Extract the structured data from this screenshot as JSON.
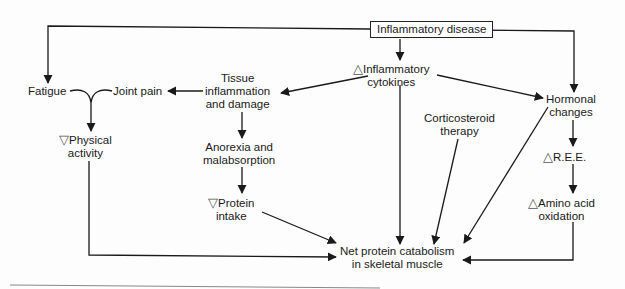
{
  "diagram": {
    "type": "flowchart",
    "title": "Inflammatory disease",
    "nodes": {
      "inflammatory_disease": {
        "label": "Inflammatory disease",
        "boxed": true
      },
      "inflammatory_cytokines": {
        "prefix": "△",
        "line1": "Inflammatory",
        "line2": "cytokines"
      },
      "tissue_inflammation": {
        "line1": "Tissue",
        "line2": "inflammation",
        "line3": "and damage"
      },
      "joint_pain": {
        "label": "Joint pain"
      },
      "fatigue": {
        "label": "Fatigue"
      },
      "physical_activity": {
        "prefix": "▽",
        "line1": "Physical",
        "line2": "activity"
      },
      "anorexia": {
        "line1": "Anorexia and",
        "line2": "malabsorption"
      },
      "protein_intake": {
        "prefix": "▽",
        "line1": "Protein",
        "line2": "intake"
      },
      "corticosteroid": {
        "line1": "Corticosteroid",
        "line2": "therapy"
      },
      "hormonal_changes": {
        "line1": "Hormonal",
        "line2": "changes"
      },
      "ree": {
        "prefix": "△",
        "label": "R.E.E."
      },
      "amino_acid": {
        "prefix": "△",
        "line1": "Amino acid",
        "line2": "oxidation"
      },
      "net_protein": {
        "line1": "Net protein catabolism",
        "line2": "in skeletal muscle"
      }
    },
    "edges": [
      [
        "Inflammatory disease",
        "Fatigue"
      ],
      [
        "Inflammatory disease",
        "Inflammatory cytokines"
      ],
      [
        "Inflammatory disease",
        "Hormonal changes"
      ],
      [
        "Inflammatory cytokines",
        "Tissue inflammation and damage"
      ],
      [
        "Inflammatory cytokines",
        "Hormonal changes"
      ],
      [
        "Inflammatory cytokines",
        "Net protein catabolism in skeletal muscle"
      ],
      [
        "Tissue inflammation and damage",
        "Joint pain"
      ],
      [
        "Tissue inflammation and damage",
        "Anorexia and malabsorption"
      ],
      [
        "Fatigue",
        "Physical activity"
      ],
      [
        "Joint pain",
        "Physical activity"
      ],
      [
        "Anorexia and malabsorption",
        "Protein intake"
      ],
      [
        "Protein intake",
        "Net protein catabolism in skeletal muscle"
      ],
      [
        "Physical activity",
        "Net protein catabolism in skeletal muscle"
      ],
      [
        "Corticosteroid therapy",
        "Net protein catabolism in skeletal muscle"
      ],
      [
        "Hormonal changes",
        "Net protein catabolism in skeletal muscle"
      ],
      [
        "Hormonal changes",
        "R.E.E."
      ],
      [
        "R.E.E.",
        "Amino acid oxidation"
      ],
      [
        "Amino acid oxidation",
        "Net protein catabolism in skeletal muscle"
      ]
    ],
    "colors": {
      "line": "#1a1a1a",
      "triangle": "#555555",
      "background": "#fdfdfd"
    }
  }
}
